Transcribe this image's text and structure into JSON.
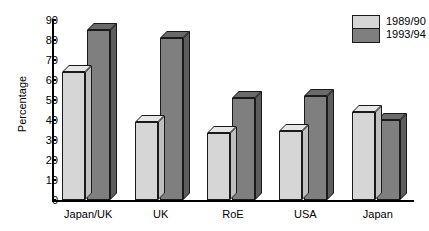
{
  "chart_data": {
    "type": "bar",
    "title": "",
    "xlabel": "",
    "ylabel": "Percentage",
    "ylim": [
      0,
      90
    ],
    "yticks": [
      0,
      10,
      20,
      30,
      40,
      50,
      60,
      70,
      80,
      90
    ],
    "grid": false,
    "legend_position": "top-right",
    "style": "grouped 3D bar chart",
    "categories": [
      "Japan/UK",
      "UK",
      "RoE",
      "USA",
      "Japan"
    ],
    "series": [
      {
        "name": "1989/90",
        "color": "#d6d6d6",
        "values": [
          64,
          39,
          33.5,
          34.5,
          44
        ]
      },
      {
        "name": "1993/94",
        "color": "#7f7f7f",
        "values": [
          85,
          81,
          51,
          52,
          40
        ]
      }
    ]
  },
  "axis": {
    "y_title": "Percentage",
    "y_tick_labels": [
      "90",
      "80",
      "70",
      "60",
      "50",
      "40",
      "30",
      "20",
      "10",
      "0"
    ]
  },
  "legend": {
    "entries": [
      {
        "label": "1989/90"
      },
      {
        "label": "1993/94"
      }
    ]
  },
  "colors": {
    "series_1989_90": "#d6d6d6",
    "series_1993_94": "#7f7f7f",
    "outline": "#1a1a1a",
    "background": "#ffffff"
  }
}
